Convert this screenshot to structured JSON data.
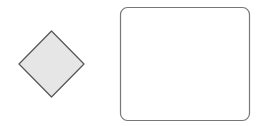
{
  "diagram": {
    "shapes": [
      {
        "id": "decision-diamond",
        "type": "diamond",
        "label": "",
        "fill": "#e6e6e6",
        "stroke": "#555555"
      },
      {
        "id": "process-box",
        "type": "rounded-rectangle",
        "label": "",
        "fill": "#ffffff",
        "stroke": "#777777"
      }
    ]
  }
}
